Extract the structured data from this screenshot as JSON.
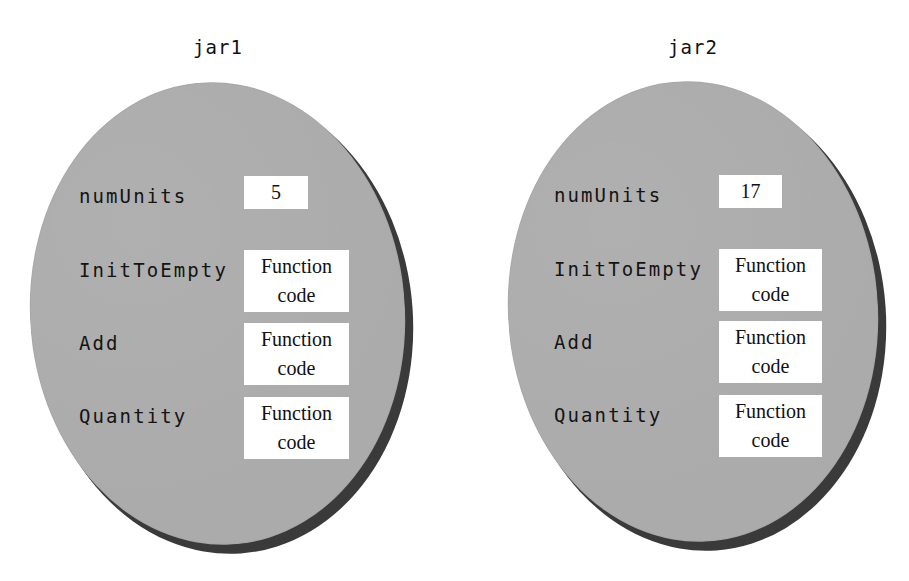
{
  "diagram": {
    "jars": [
      {
        "name": "jar1",
        "members": [
          {
            "label": "numUnits",
            "kind": "data",
            "value": "5"
          },
          {
            "label": "InitToEmpty",
            "kind": "function",
            "line1": "Function",
            "line2": "code"
          },
          {
            "label": "Add",
            "kind": "function",
            "line1": "Function",
            "line2": "code"
          },
          {
            "label": "Quantity",
            "kind": "function",
            "line1": "Function",
            "line2": "code"
          }
        ]
      },
      {
        "name": "jar2",
        "members": [
          {
            "label": "numUnits",
            "kind": "data",
            "value": "17"
          },
          {
            "label": "InitToEmpty",
            "kind": "function",
            "line1": "Function",
            "line2": "code"
          },
          {
            "label": "Add",
            "kind": "function",
            "line1": "Function",
            "line2": "code"
          },
          {
            "label": "Quantity",
            "kind": "function",
            "line1": "Function",
            "line2": "code"
          }
        ]
      }
    ],
    "colors": {
      "ellipse_fill": "#ababab",
      "ellipse_shadow": "#3a3a3a",
      "box_fill": "#ffffff",
      "text": "#111111"
    }
  }
}
